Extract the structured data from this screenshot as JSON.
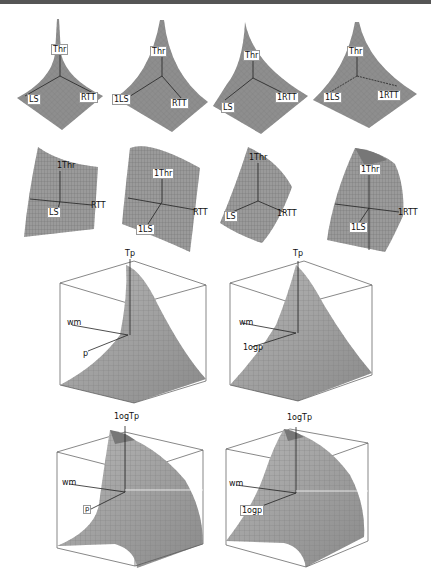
{
  "figure": {
    "rows": [
      {
        "row": 1,
        "kind": "spike-surfaces",
        "panels": [
          {
            "id": "r1c1",
            "labels": {
              "z": "Thr",
              "x": "LS",
              "y": "RTT"
            }
          },
          {
            "id": "r1c2",
            "labels": {
              "z": "Thr",
              "x": "1LS",
              "y": "RTT"
            }
          },
          {
            "id": "r1c3",
            "labels": {
              "z": "Thr",
              "x": "LS",
              "y": "1RTT"
            }
          },
          {
            "id": "r1c4",
            "labels": {
              "z": "Thr",
              "x": "1LS",
              "y": "1RTT"
            }
          }
        ]
      },
      {
        "row": 2,
        "kind": "curved-sheet-surfaces",
        "panels": [
          {
            "id": "r2c1",
            "labels": {
              "z": "1Thr",
              "x": "LS",
              "y": "RTT"
            }
          },
          {
            "id": "r2c2",
            "labels": {
              "z": "1Thr",
              "x": "1LS",
              "y": "RTT"
            }
          },
          {
            "id": "r2c3",
            "labels": {
              "z": "1Thr",
              "x": "LS",
              "y": "1RTT"
            }
          },
          {
            "id": "r2c4",
            "labels": {
              "z": "1Thr",
              "x": "1LS",
              "y": "1RTT"
            }
          }
        ]
      },
      {
        "row": 3,
        "kind": "boxed-surfaces",
        "panels": [
          {
            "id": "r3c1",
            "labels": {
              "z": "Tp",
              "a": "wm",
              "b": "p"
            }
          },
          {
            "id": "r3c2",
            "labels": {
              "z": "Tp",
              "a": "wm",
              "b": "1ogp"
            }
          }
        ]
      },
      {
        "row": 4,
        "kind": "boxed-surfaces",
        "panels": [
          {
            "id": "r4c1",
            "labels": {
              "z": "1ogTp",
              "a": "wm",
              "b": "p"
            }
          },
          {
            "id": "r4c2",
            "labels": {
              "z": "1ogTp",
              "a": "wm",
              "b": "1ogp"
            }
          }
        ]
      }
    ]
  },
  "colors": {
    "surface": "#8c8c8c",
    "surface_light": "#b4b4b4",
    "mesh": "#6a6a6a",
    "axis": "#222222",
    "box": "#555555",
    "rule": "#555555"
  }
}
